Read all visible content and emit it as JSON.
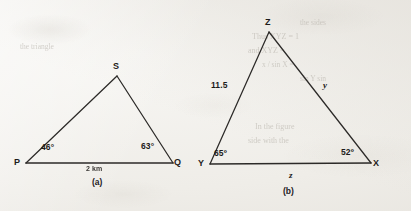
{
  "document": {
    "background_color": "#efede8",
    "ink_color": "#2c2a28",
    "figure_count": 2
  },
  "figure_a": {
    "caption": "(a)",
    "shape": "triangle",
    "vertices": [
      {
        "label": "P",
        "position": "bottom-left"
      },
      {
        "label": "Q",
        "position": "bottom-right"
      },
      {
        "label": "S",
        "position": "apex"
      }
    ],
    "angles": [
      {
        "at": "P",
        "value": "46°"
      },
      {
        "at": "Q",
        "value": "63°"
      }
    ],
    "sides": [
      {
        "between": "PQ",
        "label": "2 km"
      }
    ]
  },
  "figure_b": {
    "caption": "(b)",
    "shape": "triangle",
    "vertices": [
      {
        "label": "Y",
        "position": "bottom-left"
      },
      {
        "label": "X",
        "position": "bottom-right"
      },
      {
        "label": "Z",
        "position": "apex"
      }
    ],
    "angles": [
      {
        "at": "Y",
        "value": "65º"
      },
      {
        "at": "X",
        "value": "52º"
      }
    ],
    "sides": [
      {
        "between": "YZ",
        "label": "11.5"
      },
      {
        "between": "ZX",
        "label": "y"
      },
      {
        "between": "YX",
        "label": "z"
      }
    ]
  },
  "ghost_text": {
    "note": "faint show-through from the reverse side of the scanned page",
    "lines": [
      "the sides",
      "Thus XYZ = 1",
      "and  XYZ =",
      "x / sin X =",
      "sin Y  sin",
      "In  the  figure",
      "side  with  the",
      "the  triangle"
    ]
  }
}
